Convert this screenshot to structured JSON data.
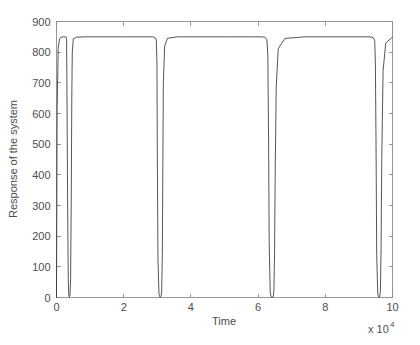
{
  "chart_data": {
    "type": "line",
    "title": "",
    "subtitle": "",
    "xlabel": "Time",
    "ylabel": "Response of the system",
    "x_multiplier_base": "x 10",
    "x_multiplier_exponent": "4",
    "xlim": [
      0,
      10
    ],
    "ylim": [
      0,
      900
    ],
    "xticks": [
      0,
      2,
      4,
      6,
      8,
      10
    ],
    "xticklabels": [
      "0",
      "2",
      "4",
      "6",
      "8",
      "10"
    ],
    "yticks": [
      0,
      100,
      200,
      300,
      400,
      500,
      600,
      700,
      800,
      900
    ],
    "yticklabels": [
      "0",
      "100",
      "200",
      "300",
      "400",
      "500",
      "600",
      "700",
      "800",
      "900"
    ],
    "grid": false,
    "legend": null,
    "legend_position": "none",
    "box": true,
    "tick_direction": "in",
    "series": [
      {
        "name": "Response of the system",
        "color": "#2b2b2b",
        "description": "Near-rectangular pulse train: the response sits at a saturated plateau of about 850 and collapses to 0 in a few extremely narrow notches.",
        "plateau_level": 850,
        "baseline_level": 0,
        "plateaus": [
          [
            0.02,
            0.3
          ],
          [
            0.47,
            2.98
          ],
          [
            3.17,
            6.28
          ],
          [
            6.52,
            9.49
          ],
          [
            9.67,
            10.0
          ]
        ],
        "notches": [
          [
            0.3,
            0.47
          ],
          [
            2.98,
            3.17
          ],
          [
            6.28,
            6.52
          ],
          [
            9.49,
            9.67
          ]
        ],
        "x": [
          0.0,
          0.02,
          0.05,
          0.09,
          0.14,
          0.2,
          0.26,
          0.29,
          0.3,
          0.31,
          0.33,
          0.35,
          0.365,
          0.38,
          0.4,
          0.42,
          0.44,
          0.455,
          0.47,
          0.5,
          0.6,
          0.9,
          1.4,
          2.0,
          2.6,
          2.85,
          2.93,
          2.97,
          2.99,
          3.0,
          3.02,
          3.05,
          3.07,
          3.09,
          3.11,
          3.13,
          3.15,
          3.165,
          3.18,
          3.22,
          3.3,
          3.6,
          4.2,
          5.0,
          5.8,
          6.1,
          6.2,
          6.26,
          6.29,
          6.31,
          6.33,
          6.36,
          6.38,
          6.4,
          6.43,
          6.45,
          6.47,
          6.49,
          6.51,
          6.54,
          6.6,
          6.8,
          7.4,
          8.2,
          9.0,
          9.3,
          9.42,
          9.47,
          9.49,
          9.51,
          9.53,
          9.56,
          9.58,
          9.6,
          9.62,
          9.64,
          9.66,
          9.68,
          9.72,
          9.8,
          10.0
        ],
        "y": [
          0,
          620,
          812,
          843,
          849,
          850,
          850,
          849,
          840,
          700,
          330,
          60,
          8,
          2,
          5,
          60,
          330,
          650,
          800,
          843,
          849,
          850,
          850,
          850,
          850,
          850,
          848,
          840,
          760,
          480,
          120,
          12,
          3,
          2,
          3,
          18,
          140,
          430,
          700,
          820,
          845,
          850,
          850,
          850,
          850,
          850,
          849,
          842,
          790,
          540,
          180,
          20,
          5,
          2,
          2,
          3,
          20,
          150,
          420,
          690,
          812,
          845,
          850,
          850,
          850,
          850,
          848,
          838,
          770,
          500,
          140,
          14,
          3,
          2,
          3,
          22,
          160,
          450,
          740,
          830,
          849
        ]
      }
    ]
  },
  "figure": {
    "background_color": "#ffffff",
    "axis_color": "#8c8c8c",
    "text_color": "#4d4d4d",
    "curve_color": "#2b2b2b"
  }
}
